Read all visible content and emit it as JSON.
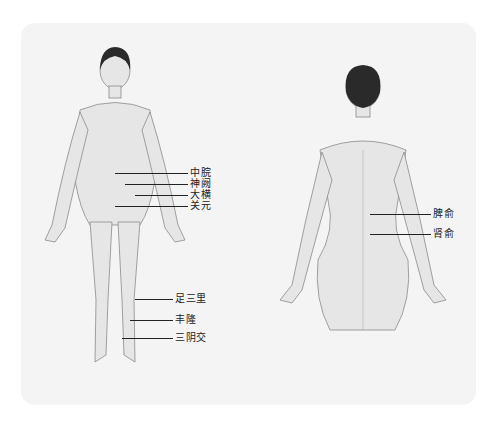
{
  "figure": {
    "front_view": {
      "points": [
        {
          "label": "中脘",
          "x": 190,
          "y": 167,
          "line_from": 115
        },
        {
          "label": "神阙",
          "x": 190,
          "y": 179,
          "line_from": 125
        },
        {
          "label": "大横",
          "x": 190,
          "y": 191,
          "line_from": 135
        },
        {
          "label": "关元",
          "x": 190,
          "y": 203,
          "line_from": 115
        },
        {
          "label": "足三里",
          "x": 175,
          "y": 296,
          "line_from": 135
        },
        {
          "label": "丰隆",
          "x": 175,
          "y": 318,
          "line_from": 130
        },
        {
          "label": "三阴交",
          "x": 175,
          "y": 336,
          "line_from": 122
        }
      ]
    },
    "back_view": {
      "points": [
        {
          "label": "脾俞",
          "x": 433,
          "y": 212,
          "line_from": 370
        },
        {
          "label": "肾俞",
          "x": 433,
          "y": 232,
          "line_from": 370
        }
      ]
    },
    "colors": {
      "panel": "#f4f4f4",
      "body": "#e6e6e6",
      "outline": "#8a8a8a",
      "hair": "#2a2a2a",
      "text": "#222222"
    }
  }
}
